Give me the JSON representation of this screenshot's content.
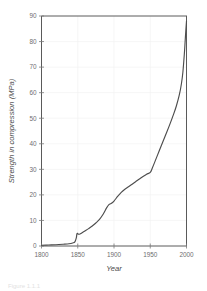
{
  "figure": {
    "caption_fragment": "Figure 1.1.1",
    "background_color": "#ffffff",
    "line_color": "#4d4d4d",
    "axis_color": "#5a5a5a",
    "tick_label_color": "#6e6e6e"
  },
  "chart_data": {
    "type": "line",
    "title": "",
    "subtitle": "",
    "xlabel": "Year",
    "ylabel": "Strength in compression (MPa)",
    "xlim": [
      1800,
      2000
    ],
    "ylim": [
      0,
      90
    ],
    "xticks": [
      1800,
      1850,
      1900,
      1950,
      2000
    ],
    "xtick_labels": [
      "1800",
      "1850",
      "1900",
      "1950",
      "2000"
    ],
    "yticks": [
      0,
      10,
      20,
      30,
      40,
      50,
      60,
      70,
      80,
      90
    ],
    "ytick_labels": [
      "0",
      "10",
      "20",
      "30",
      "40",
      "50",
      "60",
      "70",
      "80",
      "90"
    ],
    "grid": true,
    "legend": null,
    "legend_position": "none",
    "annotations": [],
    "series": [
      {
        "name": "Strength in compression",
        "x": [
          1800,
          1810,
          1820,
          1830,
          1838,
          1843,
          1846,
          1848,
          1849,
          1851,
          1853,
          1856,
          1860,
          1865,
          1870,
          1875,
          1880,
          1885,
          1890,
          1893,
          1896,
          1900,
          1905,
          1910,
          1915,
          1920,
          1925,
          1930,
          1935,
          1940,
          1945,
          1950,
          1953,
          1957,
          1962,
          1967,
          1972,
          1977,
          1982,
          1986,
          1990,
          1993,
          1995,
          1997,
          1998,
          1999,
          2000
        ],
        "y": [
          0.3,
          0.4,
          0.5,
          0.7,
          0.9,
          1.2,
          1.6,
          3.2,
          4.9,
          4.6,
          4.7,
          5.2,
          5.9,
          6.8,
          7.8,
          9.0,
          10.4,
          12.4,
          15.0,
          16.2,
          16.6,
          17.6,
          19.4,
          21.0,
          22.2,
          23.2,
          24.2,
          25.2,
          26.2,
          27.2,
          28.1,
          28.8,
          30.6,
          33.4,
          37.0,
          40.5,
          44.0,
          47.6,
          51.4,
          54.8,
          59.0,
          63.5,
          68.0,
          75.0,
          79.5,
          84.0,
          88.0
        ]
      }
    ]
  }
}
